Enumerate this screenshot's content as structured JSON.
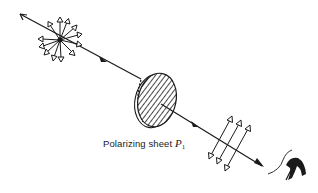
{
  "figure": {
    "caption_label": {
      "text": "Polarizing sheet ",
      "symbol": "P",
      "subscript": "1"
    },
    "elements": [
      {
        "name": "light-ray",
        "description": "Light ray traveling from upper-left to lower-right"
      },
      {
        "name": "unpolarized-light",
        "description": "Star burst of arrows in all directions representing unpolarized light"
      },
      {
        "name": "polarizing-sheet",
        "description": "Hatched elliptical disc (polarizing sheet P1) with vertical-ish transmission lines"
      },
      {
        "name": "polarized-light",
        "description": "Three parallel double-headed arrows representing linearly polarized light"
      },
      {
        "name": "observer-eye",
        "description": "Eye of observer at end of ray"
      }
    ],
    "colors": {
      "ink": "#1a1a1a",
      "background": "#ffffff"
    }
  }
}
